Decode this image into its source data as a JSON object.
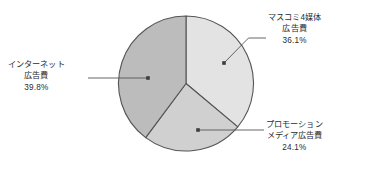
{
  "chart_data": {
    "type": "pie",
    "title": "",
    "subtitle": "",
    "xlabel": "",
    "ylabel": "",
    "legend_position": "none",
    "grid": false,
    "labels": [
      "マスコミ4媒体広告費",
      "プロモーションメディア広告費",
      "インターネット広告費"
    ],
    "values": [
      36.1,
      24.1,
      39.8
    ],
    "value_suffix": "%",
    "start_angle_deg": 0,
    "direction": "clockwise",
    "colors": [
      "#e3e3e3",
      "#d0d0d0",
      "#bcbcbc"
    ],
    "slices": [
      {
        "id": "mass",
        "name_lines": [
          "マスコミ4媒体",
          "広告費"
        ],
        "percent_label": "36.1%",
        "value": 36.1,
        "color": "#e3e3e3"
      },
      {
        "id": "promo",
        "name_lines": [
          "プロモーション",
          "メディア広告費"
        ],
        "percent_label": "24.1%",
        "value": 24.1,
        "color": "#d0d0d0"
      },
      {
        "id": "internet",
        "name_lines": [
          "インターネット",
          "広告費"
        ],
        "percent_label": "39.8%",
        "value": 39.8,
        "color": "#bcbcbc"
      }
    ]
  },
  "style": {
    "background": "#ffffff",
    "outline_color": "#555555",
    "leader_color": "#555555",
    "text_color": "#2b2b2b"
  },
  "callouts": {
    "mass": {
      "line1": "マスコミ4媒体",
      "line2": "広告費",
      "percent": "36.1%"
    },
    "internet": {
      "line1": "インターネット",
      "line2": "広告費",
      "percent": "39.8%"
    },
    "promo": {
      "line1": "プロモーション",
      "line2": "メディア広告費",
      "percent": "24.1%"
    }
  }
}
